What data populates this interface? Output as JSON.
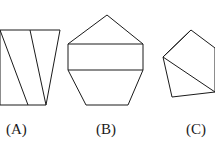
{
  "page": {
    "background_color": "#ffffff",
    "stroke_color": "#1a1a1a",
    "text_color": "#1a1a1a",
    "width": 215,
    "height": 155
  },
  "figures": [
    {
      "id": "a",
      "label": "(A)",
      "shape_name": "cropped-quadrilateral-with-internal-lines",
      "description": "Tapered quadrilateral cropped at the left image edge, with two internal slanted lines forming a V shape",
      "label_position": {
        "x": 6,
        "y": 122
      },
      "outline_points": "0,30 60,30 46,105 0,105",
      "internal_lines": [
        {
          "x1": 0,
          "y1": 30,
          "x2": 28,
          "y2": 105
        },
        {
          "x1": 30,
          "y1": 30,
          "x2": 46,
          "y2": 105
        }
      ]
    },
    {
      "id": "b",
      "label": "(B)",
      "shape_name": "hexagon-with-horizontal-band",
      "description": "Symmetric hexagon with an apex on top and a horizontal rectangular band across the middle",
      "label_position": {
        "x": 96,
        "y": 122
      },
      "outline_points": "107,15 143,44 143,70 128,105 86,105 68,70 68,44",
      "internal_lines": [
        {
          "x1": 68,
          "y1": 44,
          "x2": 143,
          "y2": 44
        },
        {
          "x1": 68,
          "y1": 70,
          "x2": 143,
          "y2": 70
        }
      ]
    },
    {
      "id": "c",
      "label": "(C)",
      "shape_name": "pentagon-with-triangulation",
      "description": "Tilted pentagon cropped at the right image edge, triangulated by two lines radiating from the top apex",
      "label_position": {
        "x": 186,
        "y": 122
      },
      "outline_points": "191,30 215,48 215,92 172,97 163,57",
      "internal_lines": [
        {
          "x1": 191,
          "y1": 30,
          "x2": 163,
          "y2": 57
        },
        {
          "x1": 163,
          "y1": 57,
          "x2": 215,
          "y2": 92
        }
      ]
    }
  ]
}
